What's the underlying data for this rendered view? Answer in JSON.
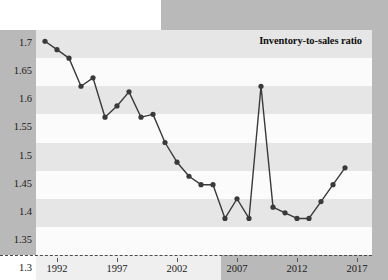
{
  "title": "Inventory-to-sales ratio",
  "colors": {
    "line": "#3a3a3a",
    "marker": "#3a3a3a",
    "band_shade": "#e6e6e6",
    "band_plain": "#fbfbfb",
    "page_margin": "#b9b9b9",
    "text": "#1a1a1a"
  },
  "chart_data": {
    "type": "line",
    "title": "Inventory-to-sales ratio",
    "xlabel": "",
    "ylabel": "",
    "xlim": [
      1990.5,
      2018.0
    ],
    "ylim": [
      1.3,
      1.7
    ],
    "grid": "horizontal-banded",
    "legend": "none",
    "ytick_labels": [
      "1.7",
      "1.65",
      "1.6",
      "1.55",
      "1.5",
      "1.45",
      "1.4",
      "1.35",
      "1.3"
    ],
    "ytick_values": [
      1.7,
      1.65,
      1.6,
      1.55,
      1.5,
      1.45,
      1.4,
      1.35,
      1.3
    ],
    "xtick_labels": [
      "1992",
      "1997",
      "2002",
      "2007",
      "2012",
      "2017"
    ],
    "xtick_values": [
      1992,
      1997,
      2002,
      2007,
      2012,
      2017
    ],
    "series": [
      {
        "name": "Inventory-to-sales ratio",
        "x": [
          1991,
          1992,
          1993,
          1994,
          1995,
          1996,
          1997,
          1998,
          1999,
          2000,
          2001,
          2002,
          2003,
          2004,
          2005,
          2006,
          2007,
          2008,
          2009,
          2010,
          2011,
          2012,
          2013,
          2014,
          2015,
          2016
        ],
        "values": [
          1.68,
          1.665,
          1.65,
          1.6,
          1.615,
          1.545,
          1.565,
          1.59,
          1.545,
          1.55,
          1.5,
          1.465,
          1.44,
          1.425,
          1.425,
          1.365,
          1.4,
          1.365,
          1.6,
          1.385,
          1.375,
          1.365,
          1.365,
          1.395,
          1.425,
          1.455
        ]
      }
    ]
  }
}
